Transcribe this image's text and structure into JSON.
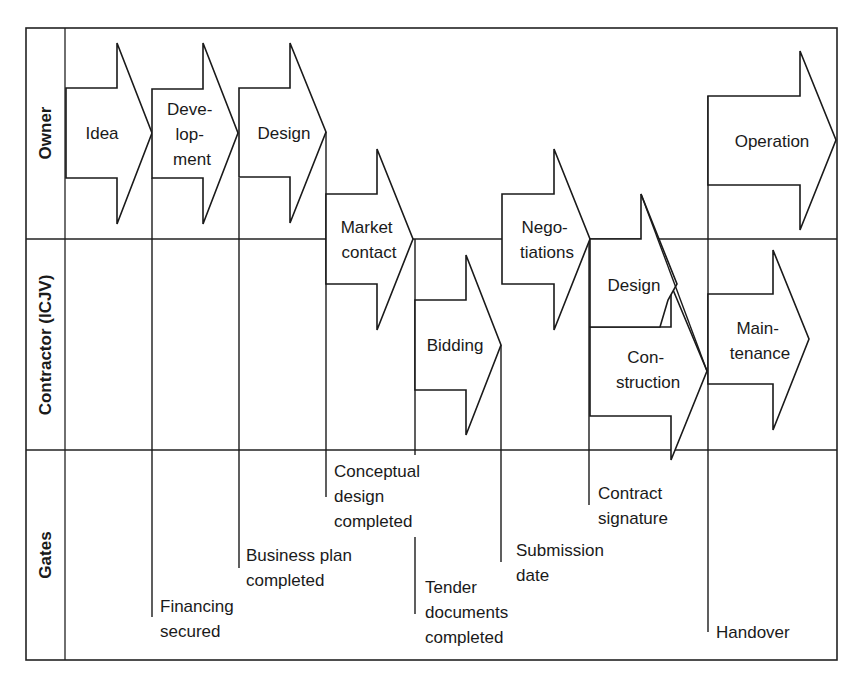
{
  "diagram": {
    "type": "swimlane-process",
    "lanes": [
      {
        "id": "owner",
        "label": "Owner"
      },
      {
        "id": "contractor",
        "label": "Contractor (ICJV)"
      },
      {
        "id": "gates",
        "label": "Gates"
      }
    ],
    "phases": [
      {
        "id": "idea",
        "lane": "owner",
        "lines": [
          "Idea"
        ]
      },
      {
        "id": "development",
        "lane": "owner",
        "lines": [
          "Deve-",
          "lop-",
          "ment"
        ]
      },
      {
        "id": "design-owner",
        "lane": "owner",
        "lines": [
          "Design"
        ]
      },
      {
        "id": "market-contact",
        "lane": "owner/contractor",
        "lines": [
          "Market",
          "contact"
        ]
      },
      {
        "id": "bidding",
        "lane": "contractor",
        "lines": [
          "Bidding"
        ]
      },
      {
        "id": "negotiations",
        "lane": "owner/contractor",
        "lines": [
          "Nego-",
          "tiations"
        ]
      },
      {
        "id": "design-contractor",
        "lane": "contractor",
        "lines": [
          "Design"
        ]
      },
      {
        "id": "construction",
        "lane": "contractor",
        "lines": [
          "Con-",
          "struction"
        ]
      },
      {
        "id": "operation",
        "lane": "owner",
        "lines": [
          "Operation"
        ]
      },
      {
        "id": "maintenance",
        "lane": "contractor",
        "lines": [
          "Main-",
          "tenance"
        ]
      }
    ],
    "gates": [
      {
        "id": "financing-secured",
        "lines": [
          "Financing",
          "secured"
        ]
      },
      {
        "id": "business-plan-completed",
        "lines": [
          "Business plan",
          "completed"
        ]
      },
      {
        "id": "conceptual-design-completed",
        "lines": [
          "Conceptual",
          "design",
          "completed"
        ]
      },
      {
        "id": "tender-documents-completed",
        "lines": [
          "Tender",
          "documents",
          "completed"
        ]
      },
      {
        "id": "submission-date",
        "lines": [
          "Submission",
          "date"
        ]
      },
      {
        "id": "contract-signature",
        "lines": [
          "Contract",
          "signature"
        ]
      },
      {
        "id": "handover",
        "lines": [
          "Handover"
        ]
      }
    ]
  }
}
